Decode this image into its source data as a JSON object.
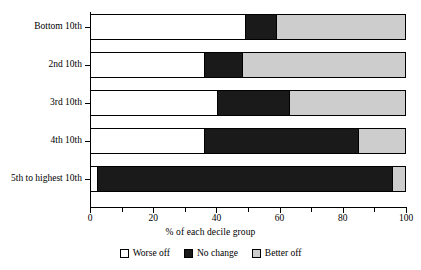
{
  "chart_data": {
    "type": "bar",
    "orientation": "horizontal",
    "stacked": true,
    "title": "",
    "xlabel": "% of each decile group",
    "ylabel": "",
    "xlim": [
      0,
      100
    ],
    "xticks": [
      0,
      10,
      20,
      30,
      40,
      50,
      60,
      70,
      80,
      90,
      100
    ],
    "xtick_labels": [
      "0",
      "",
      "20",
      "",
      "40",
      "",
      "60",
      "",
      "80",
      "",
      "100"
    ],
    "grid": false,
    "legend_position": "bottom",
    "categories": [
      "Bottom 10th",
      "2nd 10th",
      "3rd 10th",
      "4th 10th",
      "5th to highest 10th"
    ],
    "series": [
      {
        "name": "Worse off",
        "color": "#ffffff",
        "values": [
          49,
          36,
          40,
          36,
          2
        ]
      },
      {
        "name": "No change",
        "color": "#1a1a1a",
        "values": [
          10,
          12,
          23,
          49,
          94
        ]
      },
      {
        "name": "Better off",
        "color": "#cdcdcd",
        "values": [
          41,
          52,
          37,
          15,
          4
        ]
      }
    ]
  },
  "axis": {
    "x_title": "% of each decile group",
    "tick_labels": [
      "0",
      "20",
      "40",
      "60",
      "80",
      "100"
    ],
    "tick_values": [
      0,
      20,
      40,
      60,
      80,
      100
    ]
  },
  "legend": {
    "items": [
      {
        "label": "Worse off",
        "swatch": "worse"
      },
      {
        "label": "No change",
        "swatch": "nochange"
      },
      {
        "label": "Better off",
        "swatch": "better"
      }
    ]
  }
}
